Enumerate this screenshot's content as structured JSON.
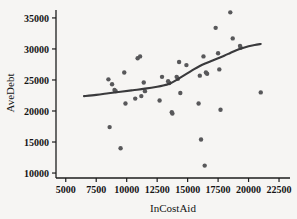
{
  "chart_data": {
    "type": "scatter",
    "title": "",
    "xlabel": "InCostAid",
    "ylabel": "AveDebt",
    "xlim": [
      4200,
      23400
    ],
    "ylim": [
      9200,
      36600
    ],
    "grid": false,
    "legend": "none",
    "xticks": [
      5000,
      7500,
      10000,
      12500,
      15000,
      17500,
      20000,
      22500
    ],
    "xtick_labels": [
      "5000",
      "7500",
      "10000",
      "12500",
      "15000",
      "17500",
      "20000",
      "22500"
    ],
    "yticks": [
      10000,
      15000,
      20000,
      25000,
      30000,
      35000
    ],
    "ytick_labels": [
      "10000",
      "15000",
      "20000",
      "25000",
      "30000",
      "35000"
    ],
    "marker_color": "#58585a",
    "curve_color": "#3a3a3c",
    "background_color": "#f6f5f3",
    "points": [
      [
        8500,
        25100
      ],
      [
        8600,
        17400
      ],
      [
        8800,
        24300
      ],
      [
        9000,
        23400
      ],
      [
        9100,
        23200
      ],
      [
        9500,
        14000
      ],
      [
        9800,
        26200
      ],
      [
        9900,
        21200
      ],
      [
        10700,
        22000
      ],
      [
        10900,
        28500
      ],
      [
        11100,
        28800
      ],
      [
        11200,
        22400
      ],
      [
        11400,
        24600
      ],
      [
        11500,
        23200
      ],
      [
        12700,
        21700
      ],
      [
        12900,
        25500
      ],
      [
        13400,
        24800
      ],
      [
        13500,
        24500
      ],
      [
        13700,
        19800
      ],
      [
        13750,
        19600
      ],
      [
        14100,
        25500
      ],
      [
        14200,
        25200
      ],
      [
        14300,
        27900
      ],
      [
        14400,
        22900
      ],
      [
        14900,
        27400
      ],
      [
        15900,
        21200
      ],
      [
        16000,
        25700
      ],
      [
        16100,
        15400
      ],
      [
        16300,
        28800
      ],
      [
        16400,
        11200
      ],
      [
        16500,
        26200
      ],
      [
        16600,
        26000
      ],
      [
        17300,
        33400
      ],
      [
        17500,
        29300
      ],
      [
        17600,
        26700
      ],
      [
        17700,
        20200
      ],
      [
        18500,
        35900
      ],
      [
        18700,
        31700
      ],
      [
        19300,
        30500
      ],
      [
        19350,
        30200
      ],
      [
        21000,
        23000
      ]
    ],
    "fit_curve": [
      [
        6500,
        22400
      ],
      [
        7500,
        22600
      ],
      [
        8500,
        22850
      ],
      [
        9500,
        23100
      ],
      [
        10500,
        23350
      ],
      [
        11500,
        23600
      ],
      [
        12500,
        23900
      ],
      [
        13000,
        24100
      ],
      [
        13500,
        24400
      ],
      [
        14000,
        24900
      ],
      [
        14500,
        25500
      ],
      [
        15000,
        26100
      ],
      [
        15500,
        26700
      ],
      [
        16000,
        27250
      ],
      [
        16500,
        27700
      ],
      [
        17000,
        28100
      ],
      [
        17500,
        28500
      ],
      [
        18000,
        28900
      ],
      [
        18500,
        29350
      ],
      [
        19000,
        29800
      ],
      [
        19500,
        30150
      ],
      [
        20000,
        30450
      ],
      [
        20500,
        30650
      ],
      [
        21000,
        30800
      ]
    ]
  }
}
